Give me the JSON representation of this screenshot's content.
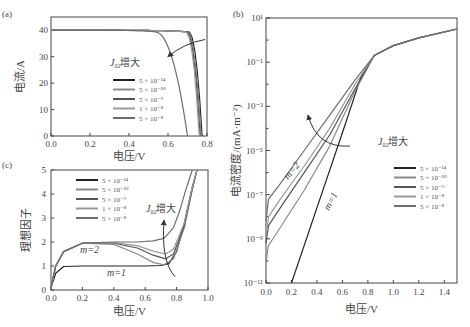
{
  "legend_values": [
    "5 × 10⁻¹⁴",
    "5 × 10⁻¹⁰",
    "5 × 10⁻⁹",
    "1 × 10⁻⁸",
    "5 × 10⁻⁸"
  ],
  "series_colors": [
    "#222222",
    "#8a8a8a",
    "#555555",
    "#9a9a9a",
    "#6e6e6e"
  ],
  "chart_data": [
    {
      "panel": "(a)",
      "type": "line",
      "title": "",
      "xlabel": "电压/V",
      "ylabel": "电流/A",
      "xlim": [
        0,
        0.8
      ],
      "ylim": [
        0,
        45
      ],
      "xticks": [
        0.0,
        0.2,
        0.4,
        0.6,
        0.8
      ],
      "xtick_labels": [
        "0.0",
        "0.2",
        "0.4",
        "0.6",
        "0.8"
      ],
      "yticks": [
        0,
        10,
        20,
        30,
        40
      ],
      "ytick_labels": [
        "0",
        "10",
        "20",
        "30",
        "40"
      ],
      "annotation": "J02增大",
      "legend_placement": "center",
      "series": [
        {
          "name": "5 × 10⁻¹⁴",
          "isc": 40,
          "voc": 0.775
        },
        {
          "name": "5 × 10⁻¹⁰",
          "isc": 40,
          "voc": 0.77
        },
        {
          "name": "5 × 10⁻⁹",
          "isc": 40,
          "voc": 0.765
        },
        {
          "name": "1 × 10⁻⁸",
          "isc": 40,
          "voc": 0.76
        },
        {
          "name": "5 × 10⁻⁸",
          "isc": 40,
          "voc": 0.7
        }
      ]
    },
    {
      "panel": "(b)",
      "type": "line",
      "title": "",
      "xlabel": "电压/V",
      "ylabel": "电流密度/(mA·m⁻²)",
      "xlim": [
        0,
        1.5
      ],
      "ylim_log10": [
        -11,
        1
      ],
      "yscale": "log",
      "xticks": [
        0.0,
        0.2,
        0.4,
        0.6,
        0.8,
        1.0,
        1.2,
        1.4
      ],
      "xtick_labels": [
        "0.0",
        "0.2",
        "0.4",
        "0.6",
        "0.8",
        "1.0",
        "1.2",
        "1.4"
      ],
      "yticks_log10": [
        1,
        -1,
        -3,
        -5,
        -7,
        -9,
        -11
      ],
      "ytick_labels": [
        "10¹",
        "10⁻¹",
        "10⁻³",
        "10⁻⁵",
        "10⁻⁷",
        "10⁻⁹",
        "10⁻¹¹"
      ],
      "annotations": [
        "J02增大",
        "m=2",
        "m=1"
      ],
      "legend_placement": "right",
      "series": [
        {
          "name": "5 × 10⁻¹⁴",
          "x": [
            0.2,
            0.4,
            0.6,
            0.75,
            0.85,
            1.0,
            1.2,
            1.5
          ],
          "log10_y": [
            -11,
            -7.6,
            -4.2,
            -1.6,
            -0.7,
            -0.25,
            0.1,
            0.5
          ]
        },
        {
          "name": "5 × 10⁻¹⁰",
          "x": [
            0.0,
            0.02,
            0.1,
            0.3,
            0.5,
            0.7,
            0.85,
            1.0,
            1.2,
            1.5
          ],
          "log10_y": [
            -10,
            -9.3,
            -8.6,
            -6.8,
            -4.8,
            -2.3,
            -0.7,
            -0.25,
            0.1,
            0.5
          ]
        },
        {
          "name": "5 × 10⁻⁹",
          "x": [
            0.0,
            0.02,
            0.1,
            0.3,
            0.5,
            0.7,
            0.85,
            1.0,
            1.2,
            1.5
          ],
          "log10_y": [
            -9.2,
            -8.4,
            -7.7,
            -6.0,
            -4.3,
            -2.2,
            -0.7,
            -0.25,
            0.1,
            0.5
          ]
        },
        {
          "name": "1 × 10⁻⁸",
          "x": [
            0.0,
            0.02,
            0.1,
            0.3,
            0.5,
            0.7,
            0.85,
            1.0,
            1.2,
            1.5
          ],
          "log10_y": [
            -8.9,
            -8.0,
            -7.3,
            -5.7,
            -4.0,
            -2.0,
            -0.7,
            -0.25,
            0.1,
            0.5
          ]
        },
        {
          "name": "5 × 10⁻⁸",
          "x": [
            0.0,
            0.02,
            0.1,
            0.3,
            0.5,
            0.7,
            0.85,
            1.0,
            1.2,
            1.5
          ],
          "log10_y": [
            -8.2,
            -7.2,
            -6.6,
            -5.0,
            -3.4,
            -1.8,
            -0.7,
            -0.25,
            0.1,
            0.5
          ]
        }
      ]
    },
    {
      "panel": "(c)",
      "type": "line",
      "title": "",
      "xlabel": "电压/V",
      "ylabel": "理想因子",
      "xlim": [
        0,
        1.0
      ],
      "ylim": [
        0,
        5
      ],
      "xticks": [
        0.0,
        0.2,
        0.4,
        0.6,
        0.8,
        1.0
      ],
      "xtick_labels": [
        "0.0",
        "0.2",
        "0.4",
        "0.6",
        "0.8",
        "1.0"
      ],
      "yticks": [
        0,
        1,
        2,
        3,
        4,
        5
      ],
      "ytick_labels": [
        "0",
        "1",
        "2",
        "3",
        "4",
        "5"
      ],
      "annotations": [
        "J02增大",
        "m=2",
        "m=1"
      ],
      "legend_placement": "top-left",
      "series": [
        {
          "name": "5 × 10⁻¹⁴",
          "x": [
            0.0,
            0.03,
            0.08,
            0.2,
            0.4,
            0.6,
            0.7,
            0.75,
            0.8,
            0.85,
            0.9,
            0.93
          ],
          "y": [
            0.1,
            0.7,
            0.98,
            1.0,
            1.0,
            1.0,
            1.02,
            1.1,
            1.6,
            2.8,
            4.3,
            5.0
          ]
        },
        {
          "name": "5 × 10⁻¹⁰",
          "x": [
            0.0,
            0.03,
            0.08,
            0.2,
            0.4,
            0.55,
            0.65,
            0.72,
            0.78,
            0.85,
            0.9,
            0.93
          ],
          "y": [
            0.1,
            1.0,
            1.6,
            1.95,
            1.9,
            1.5,
            1.15,
            1.05,
            1.3,
            2.6,
            4.2,
            5.0
          ]
        },
        {
          "name": "5 × 10⁻⁹",
          "x": [
            0.0,
            0.03,
            0.08,
            0.2,
            0.4,
            0.55,
            0.65,
            0.73,
            0.78,
            0.85,
            0.9,
            0.93
          ],
          "y": [
            0.1,
            1.0,
            1.6,
            1.95,
            1.95,
            1.75,
            1.45,
            1.3,
            1.5,
            2.7,
            4.2,
            5.0
          ]
        },
        {
          "name": "1 × 10⁻⁸",
          "x": [
            0.0,
            0.03,
            0.08,
            0.2,
            0.4,
            0.55,
            0.65,
            0.73,
            0.78,
            0.85,
            0.9,
            0.93
          ],
          "y": [
            0.1,
            1.0,
            1.6,
            1.95,
            1.97,
            1.85,
            1.62,
            1.5,
            1.7,
            2.8,
            4.3,
            5.0
          ]
        },
        {
          "name": "5 × 10⁻⁸",
          "x": [
            0.0,
            0.03,
            0.08,
            0.2,
            0.4,
            0.55,
            0.65,
            0.72,
            0.78,
            0.82,
            0.86,
            0.9
          ],
          "y": [
            0.1,
            1.0,
            1.6,
            1.95,
            2.0,
            2.0,
            2.05,
            2.15,
            2.6,
            3.3,
            4.2,
            5.0
          ]
        }
      ]
    }
  ],
  "text": {
    "panel_a": "(a)",
    "panel_b": "(b)",
    "panel_c": "(c)",
    "j02_prefix": "J",
    "j02_sub": "02",
    "j02_suffix": "增大",
    "m1": "m=1",
    "m2": "m=2"
  }
}
